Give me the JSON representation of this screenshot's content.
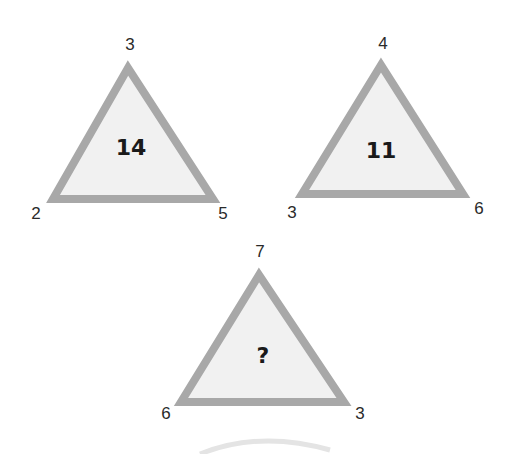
{
  "puzzle": {
    "triangles": [
      {
        "top": "3",
        "left": "2",
        "right": "5",
        "center": "14"
      },
      {
        "top": "4",
        "left": "3",
        "right": "6",
        "center": "11"
      },
      {
        "top": "7",
        "left": "6",
        "right": "3",
        "center": "?"
      }
    ]
  },
  "colors": {
    "border": "#a8a8a8",
    "fill": "#f1f1f1",
    "text": "#2a2a2a"
  }
}
